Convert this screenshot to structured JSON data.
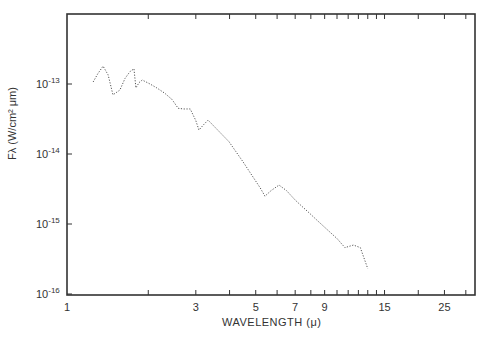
{
  "chart_data": {
    "type": "scatter",
    "title": "",
    "xlabel": "WAVELENGTH (μ)",
    "ylabel": "Fλ (W/cm² μm)",
    "xscale": "log",
    "yscale": "log",
    "xlim": [
      1,
      31
    ],
    "ylim": [
      1e-16,
      1e-12
    ],
    "grid": false,
    "legend": null,
    "x_tick_labels": [
      {
        "value": 1,
        "label": "1"
      },
      {
        "value": 3,
        "label": "3"
      },
      {
        "value": 5,
        "label": "5"
      },
      {
        "value": 7,
        "label": "7"
      },
      {
        "value": 9,
        "label": "9"
      },
      {
        "value": 15,
        "label": "15"
      },
      {
        "value": 25,
        "label": "25"
      }
    ],
    "x_minor_ticks": [
      2,
      3,
      4,
      5,
      6,
      7,
      8,
      9,
      10,
      11,
      12,
      13,
      14,
      15,
      20,
      25,
      30
    ],
    "y_tick_labels": [
      {
        "value": 1e-13,
        "base": "10",
        "exp": "-13"
      },
      {
        "value": 1e-14,
        "base": "10",
        "exp": "-14"
      },
      {
        "value": 1e-15,
        "base": "10",
        "exp": "-15"
      },
      {
        "value": 1e-16,
        "base": "10",
        "exp": "-16"
      }
    ],
    "series": [
      {
        "name": "spectrum",
        "style": "dotted",
        "x": [
          1.25,
          1.3,
          1.36,
          1.42,
          1.48,
          1.57,
          1.64,
          1.71,
          1.77,
          1.8,
          1.85,
          1.9,
          2.03,
          2.15,
          2.3,
          2.45,
          2.58,
          2.7,
          2.86,
          3.0,
          3.08,
          3.2,
          3.33,
          3.5,
          3.75,
          3.98,
          4.49,
          4.8,
          5.19,
          5.41,
          5.7,
          6.1,
          6.5,
          7.0,
          7.4,
          7.8,
          8.5,
          9.3,
          10.0,
          10.7,
          11.5,
          12.2,
          13.0
        ],
        "y": [
          1.07e-13,
          1.4e-13,
          1.8e-13,
          1.35e-13,
          7e-14,
          8.2e-14,
          1.2e-13,
          1.5e-13,
          1.65e-13,
          8.8e-14,
          1.05e-13,
          1.14e-13,
          1e-13,
          8.8e-14,
          7.4e-14,
          6e-14,
          4.5e-14,
          4.4e-14,
          4.4e-14,
          3e-14,
          2.2e-14,
          2.6e-14,
          3.05e-14,
          2.5e-14,
          1.9e-14,
          1.5e-14,
          7.7e-15,
          5.2e-15,
          3.3e-15,
          2.5e-15,
          3e-15,
          3.6e-15,
          3e-15,
          2.2e-15,
          1.8e-15,
          1.5e-15,
          1.1e-15,
          8e-16,
          6.2e-16,
          4.6e-16,
          5e-16,
          4.6e-16,
          2.3e-16
        ]
      }
    ]
  }
}
